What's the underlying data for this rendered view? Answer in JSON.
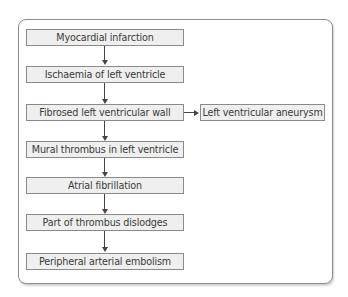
{
  "diagram": {
    "type": "flowchart",
    "main_chain": [
      {
        "id": "n1",
        "label": "Myocardial infarction"
      },
      {
        "id": "n2",
        "label": "Ischaemia of left ventricle"
      },
      {
        "id": "n3",
        "label": "Fibrosed left ventricular wall"
      },
      {
        "id": "n4",
        "label": "Mural thrombus in left ventricle"
      },
      {
        "id": "n5",
        "label": "Atrial fibrillation"
      },
      {
        "id": "n6",
        "label": "Part of thrombus dislodges"
      },
      {
        "id": "n7",
        "label": "Peripheral arterial embolism"
      }
    ],
    "side_node": {
      "id": "s1",
      "label": "Left ventricular aneurysm"
    },
    "edges": [
      {
        "from": "n1",
        "to": "n2"
      },
      {
        "from": "n2",
        "to": "n3"
      },
      {
        "from": "n3",
        "to": "s1"
      },
      {
        "from": "n3",
        "to": "n4"
      },
      {
        "from": "n4",
        "to": "n5"
      },
      {
        "from": "n5",
        "to": "n6"
      },
      {
        "from": "n6",
        "to": "n7"
      }
    ],
    "colors": {
      "box_fill": "#efefef",
      "box_border": "#8a8a8a",
      "arrow": "#444444",
      "frame_border": "#8c8c8c"
    }
  }
}
